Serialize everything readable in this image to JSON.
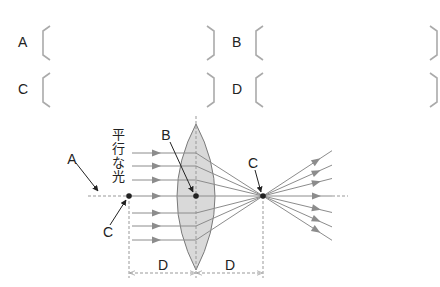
{
  "answer_blanks": [
    {
      "label": "A",
      "x": 18,
      "y": 43,
      "bx": 40,
      "bw": 170
    },
    {
      "label": "B",
      "x": 232,
      "y": 43,
      "bx": 253,
      "bw": 180
    },
    {
      "label": "C",
      "x": 18,
      "y": 90,
      "bx": 40,
      "bw": 170
    },
    {
      "label": "D",
      "x": 232,
      "y": 90,
      "bx": 253,
      "bw": 180
    }
  ],
  "diagram": {
    "parallel_light_label": "平行な光",
    "labels": {
      "A": "A",
      "B": "B",
      "C_left": "C",
      "C_right": "C",
      "D_left": "D",
      "D_right": "D"
    },
    "colors": {
      "lens_fill": "#d9d9d9",
      "lens_stroke": "#7a7a7a",
      "ray": "#8c8c8c",
      "arrowhead": "#8c8c8c",
      "point": "#222222",
      "dashed": "#999999",
      "bracket": "#aaaaaa"
    }
  }
}
